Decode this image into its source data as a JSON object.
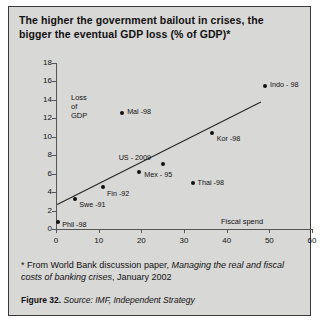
{
  "figure": {
    "title": "The higher the government bailout in crises, the bigger the eventual GDP loss (% of GDP)*",
    "footnote_prefix": "* From World Bank discussion paper, ",
    "footnote_italic": "Managing the real and fiscal costs of banking crises",
    "footnote_suffix": ", January 2002",
    "caption_label": "Figure 32.",
    "caption_source": "Source:  IMF, Independent Strategy"
  },
  "chart_data": {
    "type": "scatter",
    "title": "The higher the government bailout in crises, the bigger the eventual GDP loss (% of GDP)*",
    "xlabel": "Fiscal spend",
    "ylabel": "Loss of GDP",
    "xlim": [
      0,
      60
    ],
    "ylim": [
      0,
      18
    ],
    "xticks": [
      0,
      10,
      20,
      30,
      40,
      50,
      60
    ],
    "yticks": [
      0,
      2,
      4,
      6,
      8,
      10,
      12,
      14,
      16,
      18
    ],
    "grid": false,
    "legend": "none",
    "points": [
      {
        "label": "Phil -98",
        "x": 0.5,
        "y": 0.8,
        "label_dx": 4,
        "label_dy": 1
      },
      {
        "label": "Swe -91",
        "x": 4.5,
        "y": 3.3,
        "label_dx": 4,
        "label_dy": 4
      },
      {
        "label": "Fin -92",
        "x": 11.0,
        "y": 4.6,
        "label_dx": 4,
        "label_dy": 5
      },
      {
        "label": "Mal -98",
        "x": 15.5,
        "y": 12.6,
        "label_dx": 5,
        "label_dy": -3
      },
      {
        "label": "Mex - 95",
        "x": 19.5,
        "y": 6.2,
        "label_dx": 5,
        "label_dy": 1
      },
      {
        "label": "US - 2009",
        "x": 25.0,
        "y": 7.0,
        "label_dx": -44,
        "label_dy": -8
      },
      {
        "label": "Thai -98",
        "x": 32.0,
        "y": 5.0,
        "label_dx": 5,
        "label_dy": -2
      },
      {
        "label": "Kor -98",
        "x": 36.5,
        "y": 10.4,
        "label_dx": 5,
        "label_dy": 4
      },
      {
        "label": "Indo - 98",
        "x": 49.0,
        "y": 15.5,
        "label_dx": 5,
        "label_dy": -3
      }
    ],
    "trendline": {
      "x0": 0.3,
      "y0": 2.7,
      "x1": 48.0,
      "y1": 13.8
    }
  }
}
